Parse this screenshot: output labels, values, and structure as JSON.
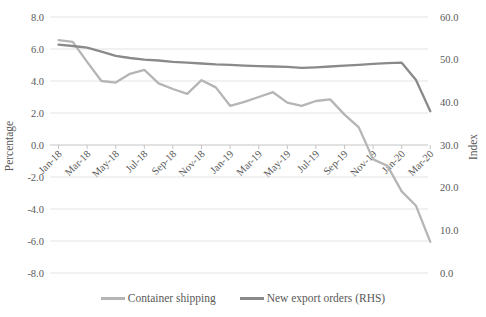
{
  "chart_data": {
    "type": "line",
    "title": "",
    "categories": [
      "Jan-18",
      "Feb-18",
      "Mar-18",
      "Apr-18",
      "May-18",
      "Jun-18",
      "Jul-18",
      "Aug-18",
      "Sep-18",
      "Oct-18",
      "Nov-18",
      "Dec-18",
      "Jan-19",
      "Feb-19",
      "Mar-19",
      "Apr-19",
      "May-19",
      "Jun-19",
      "Jul-19",
      "Aug-19",
      "Sep-19",
      "Oct-19",
      "Nov-19",
      "Dec-19",
      "Jan-20",
      "Feb-20",
      "Mar-20"
    ],
    "x_label_interval": 2,
    "x_tick_labels_shown": [
      "Jan-18",
      "Mar-18",
      "May-18",
      "Jul-18",
      "Sep-18",
      "Nov-18",
      "Jan-19",
      "Mar-19",
      "May-19",
      "Jul-19",
      "Sep-19",
      "Nov-19",
      "Jan-20",
      "Mar-20"
    ],
    "series": [
      {
        "name": "Container shipping",
        "axis": "left",
        "color": "#b5b5b5",
        "values": [
          6.55,
          6.45,
          5.2,
          4.0,
          3.9,
          4.45,
          4.7,
          3.85,
          3.5,
          3.2,
          4.05,
          3.6,
          2.45,
          2.7,
          3.0,
          3.3,
          2.65,
          2.45,
          2.75,
          2.85,
          1.9,
          1.1,
          -0.9,
          -1.3,
          -2.9,
          -3.8,
          -6.05
        ]
      },
      {
        "name": "New export orders (RHS)",
        "axis": "right",
        "color": "#8a8a8a",
        "values": [
          53.5,
          53.2,
          52.8,
          51.9,
          50.9,
          50.4,
          50.0,
          49.8,
          49.5,
          49.3,
          49.1,
          48.9,
          48.8,
          48.6,
          48.5,
          48.4,
          48.3,
          48.1,
          48.2,
          48.4,
          48.6,
          48.8,
          49.0,
          49.2,
          49.3,
          45.2,
          37.9
        ]
      }
    ],
    "left_axis": {
      "title": "Percentage",
      "min": -8.0,
      "max": 8.0,
      "step": 2.0,
      "tick_labels": [
        "8.0",
        "6.0",
        "4.0",
        "2.0",
        "0.0",
        "-2.0",
        "-4.0",
        "-6.0",
        "-8.0"
      ]
    },
    "right_axis": {
      "title": "Index",
      "min": 0.0,
      "max": 60.0,
      "step": 10.0,
      "tick_labels": [
        "60.0",
        "50.0",
        "40.0",
        "30.0",
        "20.0",
        "10.0",
        "0.0"
      ]
    },
    "grid": true,
    "legend_position": "bottom"
  },
  "styles": {
    "grid_color": "#e3e3e3",
    "axis_color": "#c4c4c4",
    "text_color": "#595959",
    "background": "#ffffff"
  }
}
